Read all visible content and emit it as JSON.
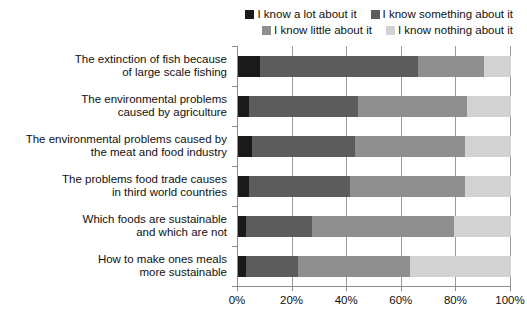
{
  "legend": {
    "rows": [
      [
        {
          "label": "I know a lot about it",
          "color": "#1a1a1a",
          "swatch_name": "legend-swatch-know-a-lot"
        },
        {
          "label": "I know something about it",
          "color": "#5c5c5c",
          "swatch_name": "legend-swatch-know-something"
        }
      ],
      [
        {
          "label": "I know little about it",
          "color": "#8f8f8f",
          "swatch_name": "legend-swatch-know-little"
        },
        {
          "label": "I know nothing about it",
          "color": "#d2d2d2",
          "swatch_name": "legend-swatch-know-nothing"
        }
      ]
    ]
  },
  "axis": {
    "x_ticks": [
      "0%",
      "20%",
      "40%",
      "60%",
      "80%",
      "100%"
    ],
    "x_tick_values": [
      0,
      20,
      40,
      60,
      80,
      100
    ]
  },
  "categories_display": [
    {
      "line1": "The extinction of fish because",
      "line2": "of large scale fishing"
    },
    {
      "line1": "The environmental problems",
      "line2": "caused by agriculture"
    },
    {
      "line1": "The environmental problems caused by",
      "line2": "the meat and food industry"
    },
    {
      "line1": "The problems food trade causes",
      "line2": "in third world countries"
    },
    {
      "line1": "Which foods are sustainable",
      "line2": "and which are not"
    },
    {
      "line1": "How to make ones meals",
      "line2": "more sustainable"
    }
  ],
  "chart_data": {
    "type": "bar",
    "orientation": "horizontal",
    "stacked": true,
    "normalized_percent": true,
    "title": "",
    "xlabel": "",
    "ylabel": "",
    "xlim": [
      0,
      100
    ],
    "grid": true,
    "legend_position": "top-right",
    "categories": [
      "The extinction of fish because of large scale fishing",
      "The environmental problems caused by agriculture",
      "The environmental problems caused by the meat and food industry",
      "The problems food trade causes in third world countries",
      "Which foods are sustainable and which are not",
      "How to make ones meals more sustainable"
    ],
    "series": [
      {
        "name": "I know a lot about it",
        "color": "#1a1a1a",
        "values": [
          8,
          4,
          5,
          4,
          3,
          3
        ]
      },
      {
        "name": "I know something about it",
        "color": "#5c5c5c",
        "values": [
          58,
          40,
          38,
          37,
          24,
          19
        ]
      },
      {
        "name": "I know little about it",
        "color": "#8f8f8f",
        "values": [
          24,
          40,
          40,
          42,
          52,
          41
        ]
      },
      {
        "name": "I know nothing about it",
        "color": "#d2d2d2",
        "values": [
          10,
          16,
          17,
          17,
          21,
          37
        ]
      }
    ]
  }
}
